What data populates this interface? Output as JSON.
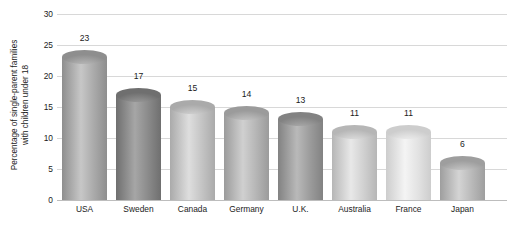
{
  "chart_data": {
    "type": "bar",
    "title": "",
    "xlabel": "",
    "ylabel": "Percentage of single-parent families with children under 18",
    "ylabel_lines": [
      "Percentage of single-parent families",
      "with children under 18"
    ],
    "categories": [
      "USA",
      "Sweden",
      "Canada",
      "Germany",
      "U.K.",
      "Australia",
      "France",
      "Japan"
    ],
    "values": [
      23,
      17,
      15,
      14,
      13,
      11,
      11,
      6
    ],
    "value_labels": [
      "23",
      "17",
      "15",
      "14",
      "13",
      "11",
      "11",
      "6"
    ],
    "ylim": [
      0,
      30
    ],
    "yticks": [
      0,
      5,
      10,
      15,
      20,
      25,
      30
    ],
    "ytick_labels": [
      "0",
      "5",
      "10",
      "15",
      "20",
      "25",
      "30"
    ],
    "grid": true,
    "grid_axis": "y",
    "legend": false,
    "bar_style": "3d-cylinder",
    "bar_colors": [
      "#a9a9a9",
      "#8a8a8a",
      "#c3c3c3",
      "#b5b5b5",
      "#9b9b9b",
      "#cfcfcf",
      "#e2e2e2",
      "#b8b8b8"
    ],
    "bar_colors_dark": [
      "#8e8e8e",
      "#6f6f6f",
      "#aaaaaa",
      "#9b9b9b",
      "#828282",
      "#b6b6b6",
      "#cdcdcd",
      "#9e9e9e"
    ],
    "bar_colors_light": [
      "#c7c7c7",
      "#a6a6a6",
      "#dedede",
      "#d0d0d0",
      "#b9b9b9",
      "#e8e8e8",
      "#f4f4f4",
      "#d4d4d4"
    ]
  },
  "colors": {
    "background": "#ffffff",
    "text": "#1b1b1b",
    "gridline": "#d8d8d8",
    "baseline": "#bdbdbd"
  }
}
